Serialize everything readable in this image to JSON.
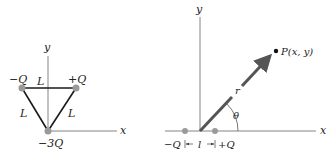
{
  "left_diagram": {
    "axes": {
      "x_label": "x",
      "y_label": "y"
    },
    "charges": [
      {
        "label": "−Q",
        "position": "top-left"
      },
      {
        "label": "+Q",
        "position": "top-right"
      },
      {
        "label": "−3Q",
        "position": "bottom (origin)"
      }
    ],
    "side_labels": {
      "top": "L",
      "left": "L",
      "right": "L"
    }
  },
  "right_diagram": {
    "axes": {
      "x_label": "x",
      "y_label": "y"
    },
    "charges": [
      {
        "label": "−Q",
        "position": "left of origin"
      },
      {
        "label": "+Q",
        "position": "right of origin"
      }
    ],
    "separation_label": "l",
    "point_label": "P(x, y)",
    "vector_label": "r",
    "angle_label": "θ"
  },
  "colors": {
    "charge": "#9a9a9a",
    "line": "#1a1a1a",
    "axis": "#555555",
    "vector": "#555555"
  }
}
